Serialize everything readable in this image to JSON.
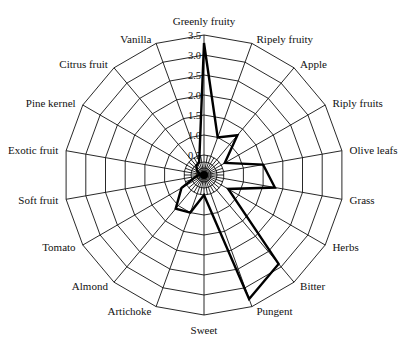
{
  "chart_data": {
    "type": "radar",
    "title": "",
    "categories": [
      "Greenly fruity",
      "Ripely fruity",
      "Apple",
      "Riply fruits",
      "Olive leafs",
      "Grass",
      "Herbs",
      "Bitter",
      "Pungent",
      "Sweet",
      "Artichoke",
      "Almond",
      "Tomato",
      "Soft fruit",
      "Exotic fruit",
      "Pine kernel",
      "Citrus fruit",
      "Vanilla"
    ],
    "series": [
      {
        "name": "Sensory profile",
        "values": [
          3.3,
          1.0,
          1.3,
          0.6,
          1.5,
          1.8,
          0.7,
          2.9,
          3.3,
          0.5,
          1.0,
          1.1,
          0.65,
          0.2,
          0.1,
          0.2,
          0.3,
          0.35
        ]
      }
    ],
    "radial_ticks": [
      "0",
      "0.5",
      "1.0",
      "1.5",
      "2.0",
      "2.5",
      "3.0",
      "3.5"
    ],
    "rlim": [
      0,
      3.5
    ],
    "grid": true,
    "legend": null
  }
}
